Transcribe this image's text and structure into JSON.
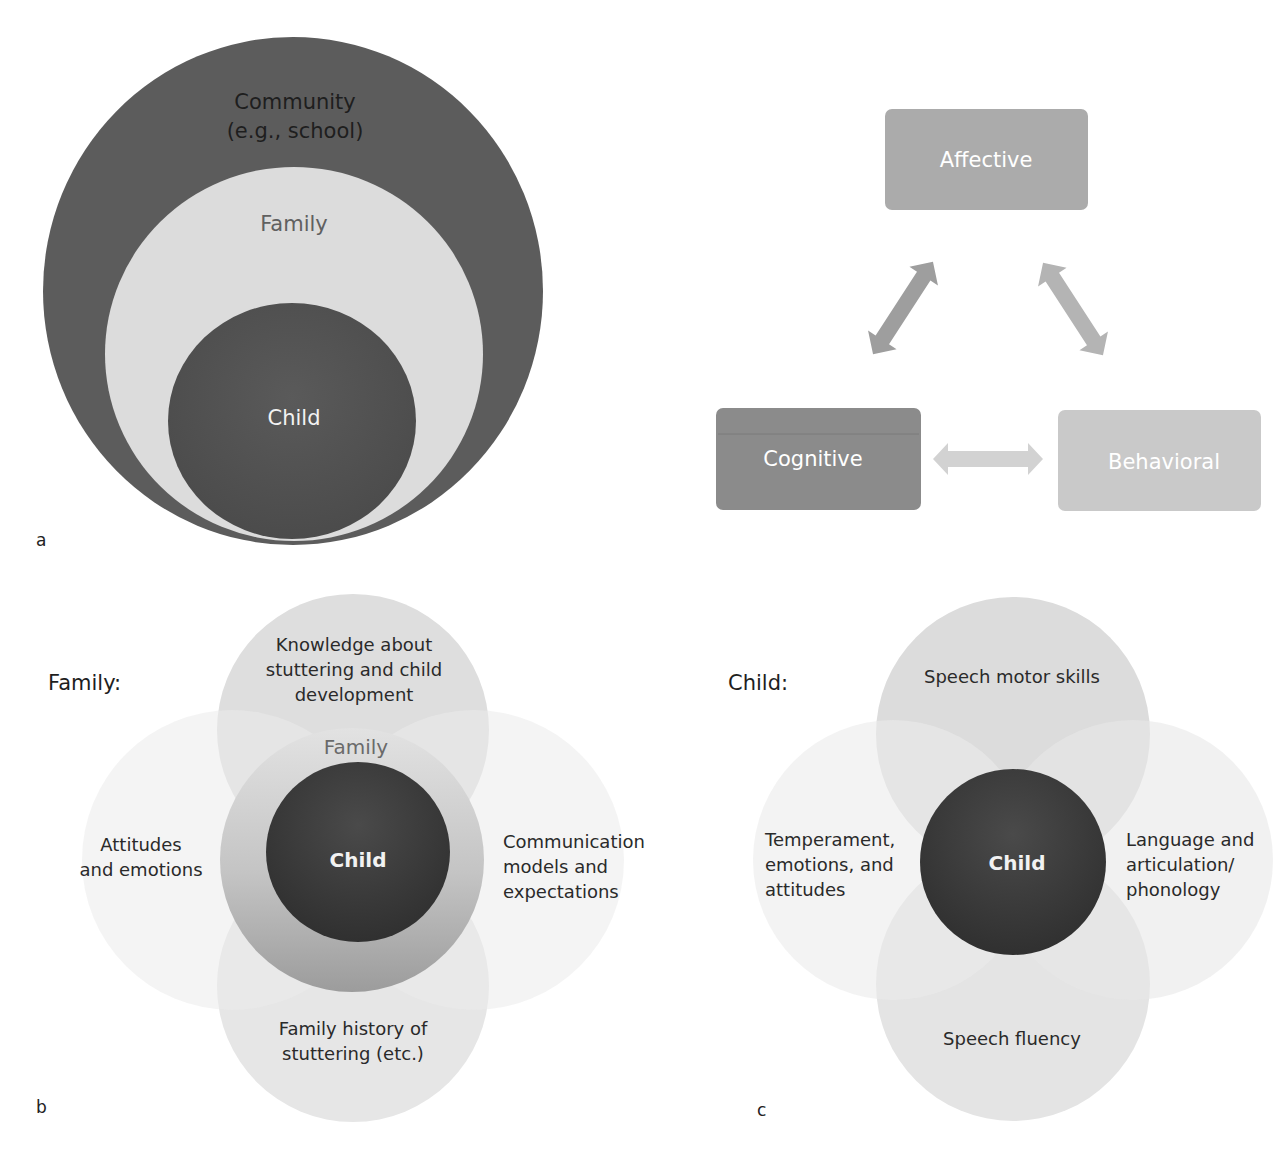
{
  "figure": {
    "panels": {
      "a": {
        "letter": "a",
        "circles": {
          "community": {
            "line1": "Community",
            "line2": "(e.g., school)",
            "color": "#5c5c5c"
          },
          "family": {
            "label": "Family",
            "color": "#dcdcdc"
          },
          "child": {
            "label": "Child",
            "color": "#555555"
          }
        }
      },
      "triad": {
        "boxes": {
          "affective": {
            "label": "Affective",
            "color": "#ababab"
          },
          "cognitive": {
            "label": "Cognitive",
            "color": "#8b8b8b"
          },
          "behavioral": {
            "label": "Behavioral",
            "color": "#c9c9c9"
          }
        },
        "arrows": [
          {
            "from": "cognitive",
            "to": "affective",
            "bidirectional": true
          },
          {
            "from": "affective",
            "to": "behavioral",
            "bidirectional": true
          },
          {
            "from": "cognitive",
            "to": "behavioral",
            "bidirectional": true
          }
        ]
      },
      "b": {
        "letter": "b",
        "title": "Family:",
        "center": {
          "label": "Child"
        },
        "ring": {
          "label": "Family"
        },
        "top": {
          "line1": "Knowledge about",
          "line2": "stuttering and child",
          "line3": "development"
        },
        "left": {
          "line1": "Attitudes",
          "line2": "and emotions"
        },
        "right": {
          "line1": "Communication",
          "line2": "models and",
          "line3": "expectations"
        },
        "bottom": {
          "line1": "Family history of",
          "line2": "stuttering (etc.)"
        }
      },
      "c": {
        "letter": "c",
        "title": "Child:",
        "center": {
          "label": "Child"
        },
        "top": {
          "label": "Speech motor skills"
        },
        "left": {
          "line1": "Temperament,",
          "line2": "emotions, and",
          "line3": "attitudes"
        },
        "right": {
          "line1": "Language and",
          "line2": "articulation/",
          "line3": "phonology"
        },
        "bottom": {
          "label": "Speech fluency"
        }
      }
    }
  }
}
